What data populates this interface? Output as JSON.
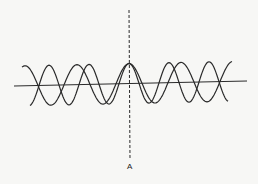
{
  "diagram": {
    "axis_label": "A",
    "colors": {
      "background": "#f7f7f5",
      "stroke": "#2a2a2a"
    },
    "waves": [
      {
        "name": "wave-1",
        "period_px": 52,
        "crest_x": 129,
        "amplitude_px": 20
      },
      {
        "name": "wave-2",
        "period_px": 40,
        "crest_x": 129,
        "amplitude_px": 20
      }
    ]
  }
}
